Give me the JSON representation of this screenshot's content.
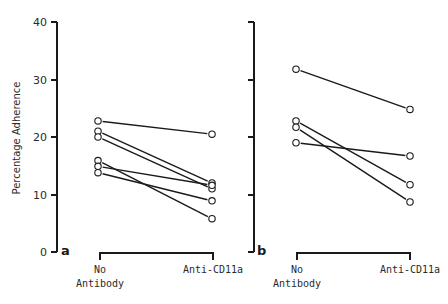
{
  "chart_data": [
    {
      "type": "line",
      "panel": "a",
      "ylabel": "Percentage Adherence",
      "xlabel": "",
      "ylim": [
        0,
        40
      ],
      "yticks": [
        0,
        10,
        20,
        30,
        40
      ],
      "categories": [
        "No Antibody",
        "Anti-CD11a"
      ],
      "grid": false,
      "series": [
        {
          "name": "subject 1",
          "values": [
            22.8,
            20.5
          ]
        },
        {
          "name": "subject 2",
          "values": [
            21.0,
            12.0
          ]
        },
        {
          "name": "subject 3",
          "values": [
            20.0,
            11.0
          ]
        },
        {
          "name": "subject 4",
          "values": [
            15.9,
            5.8
          ]
        },
        {
          "name": "subject 5",
          "values": [
            14.9,
            11.6
          ]
        },
        {
          "name": "subject 6",
          "values": [
            13.8,
            8.9
          ]
        }
      ]
    },
    {
      "type": "line",
      "panel": "b",
      "ylabel": "",
      "xlabel": "",
      "ylim": [
        0,
        40
      ],
      "yticks": [
        0,
        10,
        20,
        30,
        40
      ],
      "categories": [
        "No Antibody",
        "Anti-CD11a"
      ],
      "grid": false,
      "series": [
        {
          "name": "subject 1",
          "values": [
            31.8,
            24.8
          ]
        },
        {
          "name": "subject 2",
          "values": [
            22.8,
            11.7
          ]
        },
        {
          "name": "subject 3",
          "values": [
            21.7,
            8.7
          ]
        },
        {
          "name": "subject 4",
          "values": [
            19.0,
            16.7
          ]
        }
      ]
    }
  ],
  "labels": {
    "ylabel": "Percentage Adherence",
    "yticks": [
      "0",
      "10",
      "20",
      "30",
      "40"
    ],
    "panel_a": "a",
    "panel_b": "b",
    "cat1_line1": "No",
    "cat1_line2": "Antibody",
    "cat2": "Anti-CD11a"
  },
  "colors": {
    "ink": "#1a1a1a",
    "background": "#ffffff"
  }
}
